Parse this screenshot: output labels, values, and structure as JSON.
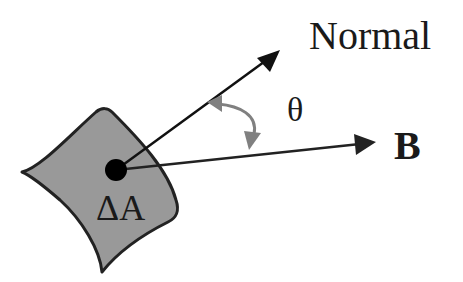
{
  "diagram": {
    "labels": {
      "normal": "Normal",
      "theta": "θ",
      "field": "B",
      "area": "ΔA"
    },
    "elements": {
      "surface_patch": {
        "fill": "#999999",
        "stroke": "#222222"
      },
      "normal_vector": {
        "from": [
          116,
          170
        ],
        "to": [
          280,
          50
        ],
        "color": "#111111"
      },
      "field_vector": {
        "from": [
          116,
          170
        ],
        "to": [
          375,
          142
        ],
        "color": "#222222"
      },
      "angle_arc": {
        "color": "#808080",
        "between": [
          "normal_vector",
          "field_vector"
        ]
      },
      "center_point": {
        "x": 116,
        "y": 170,
        "color": "#000000"
      }
    }
  }
}
